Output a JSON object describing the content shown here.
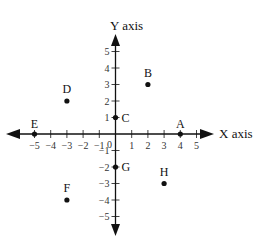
{
  "chart_data": {
    "type": "scatter",
    "title": "",
    "xlabel": "X axis",
    "ylabel": "Y axis",
    "xlim": [
      -5,
      5
    ],
    "ylim": [
      -5,
      5
    ],
    "x_ticks": [
      "-5",
      "-4",
      "-3",
      "-2",
      "-1",
      "1",
      "2",
      "3",
      "4",
      "5"
    ],
    "y_ticks": [
      "5",
      "4",
      "3",
      "2",
      "1",
      "-1",
      "-2",
      "-3",
      "-4",
      "-5"
    ],
    "origin_label": "0",
    "grid": false,
    "points": [
      {
        "label": "A",
        "x": 4,
        "y": 0
      },
      {
        "label": "B",
        "x": 2,
        "y": 3
      },
      {
        "label": "C",
        "x": 0,
        "y": 1
      },
      {
        "label": "D",
        "x": -3,
        "y": 2
      },
      {
        "label": "E",
        "x": -5,
        "y": 0
      },
      {
        "label": "F",
        "x": -3,
        "y": -4
      },
      {
        "label": "G",
        "x": 0,
        "y": -2
      },
      {
        "label": "H",
        "x": 3,
        "y": -3
      }
    ]
  },
  "colors": {
    "ink": "#111111"
  }
}
